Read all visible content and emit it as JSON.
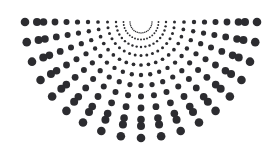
{
  "figure": {
    "type": "polar-dot-array",
    "width": 278,
    "height": 153,
    "background_color": "#ffffff",
    "dot_color": "#2c2c30",
    "center": {
      "x": 141,
      "y": 22
    },
    "angles_deg": {
      "start": 180,
      "end": 360,
      "count": 19,
      "step": 10,
      "note": "measured clockwise from the left horizontal, sweeping the lower half-plane"
    },
    "rings": {
      "count": 12,
      "radii": [
        11,
        17.5,
        25,
        33.5,
        43,
        53,
        63.5,
        74.5,
        86,
        97.5,
        104,
        116
      ],
      "dot_radii": [
        0.75,
        0.95,
        1.2,
        1.5,
        1.85,
        2.2,
        2.6,
        3.0,
        3.4,
        3.8,
        4.0,
        4.3
      ],
      "note": "dot size increases monotonically with distance from the center"
    },
    "top_row": {
      "y": 22,
      "leftmost_x": 26,
      "rightmost_x": 258,
      "note": "the outermost ring on the 180/360 degree horizontal forms the straight top edge"
    },
    "apex": {
      "x": 141,
      "y": 138,
      "note": "single lowest dot on the 270 degree arm"
    },
    "symmetry": "bilateral about the vertical line x = 141"
  },
  "chart_data": {
    "type": "scatter",
    "xlabel": "",
    "ylabel": "",
    "xlim": [
      0,
      278
    ],
    "ylim": [
      153,
      0
    ],
    "grid": false,
    "legend": null,
    "coordinate_system": "polar",
    "center": [
      141,
      22
    ],
    "theta_deg": [
      180,
      190,
      200,
      210,
      220,
      230,
      240,
      250,
      260,
      270,
      280,
      290,
      300,
      310,
      320,
      330,
      340,
      350,
      360
    ],
    "r": [
      11,
      17.5,
      25,
      33.5,
      43,
      53,
      63.5,
      74.5,
      86,
      97.5,
      104,
      116
    ],
    "marker_sizes": [
      0.75,
      0.95,
      1.2,
      1.5,
      1.85,
      2.2,
      2.6,
      3.0,
      3.4,
      3.8,
      4.0,
      4.3
    ],
    "marker_color": "#2c2c30",
    "point_count": 228,
    "annotations": []
  }
}
